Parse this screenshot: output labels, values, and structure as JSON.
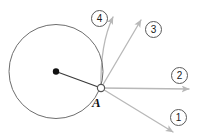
{
  "figure": {
    "type": "geometry-diagram",
    "width": 203,
    "height": 140,
    "background_color": "#ffffff",
    "circle": {
      "center_x": 56,
      "center_y": 71.5,
      "radius": 47,
      "stroke_color": "#6e6e6e",
      "stroke_width": 1,
      "fill": "none"
    },
    "center_dot": {
      "x": 56,
      "y": 71.5,
      "radius": 3.2,
      "color": "#111111"
    },
    "radius_line": {
      "from_x": 56,
      "from_y": 71.5,
      "to_x": 101,
      "to_y": 88,
      "color": "#3a3a3a",
      "stroke_width": 1.2
    },
    "point_a": {
      "label": "A",
      "x": 101,
      "y": 88,
      "marker_radius": 3.6,
      "marker_stroke": "#555555",
      "marker_fill": "#ffffff",
      "label_x": 92,
      "label_y": 96
    },
    "arrow_color": "#b8b8b8",
    "arrows": [
      {
        "label": "1",
        "name": "vector-1",
        "from_x": 101,
        "from_y": 88,
        "to_x": 173,
        "to_y": 132,
        "curved": false,
        "label_x": 170,
        "label_y": 109
      },
      {
        "label": "2",
        "name": "vector-2",
        "from_x": 101,
        "from_y": 88,
        "to_x": 189,
        "to_y": 89,
        "curved": false,
        "label_x": 171,
        "label_y": 67
      },
      {
        "label": "3",
        "name": "vector-3",
        "from_x": 101,
        "from_y": 88,
        "to_x": 141,
        "to_y": 20,
        "curved": false,
        "label_x": 145,
        "label_y": 21
      },
      {
        "label": "4",
        "name": "vector-4",
        "from_x": 101,
        "from_y": 88,
        "to_x": 113,
        "to_y": 17,
        "curved": true,
        "curve_ctrl_x": 100,
        "curve_ctrl_y": 44,
        "label_x": 91,
        "label_y": 10
      }
    ]
  }
}
